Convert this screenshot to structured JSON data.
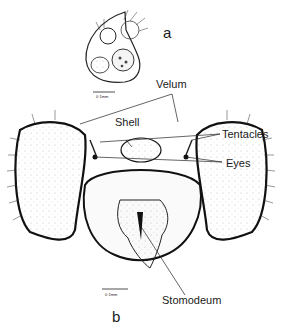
{
  "figure": {
    "panel_a": {
      "letter": "a",
      "scale_bar": "0·1mm"
    },
    "panel_b": {
      "letter": "b",
      "scale_bar": "0·1mm",
      "labels": {
        "velum": "Velum",
        "shell": "Shell",
        "tentacles": "Tentacles",
        "eyes": "Eyes",
        "stomodeum": "Stomodeum"
      }
    }
  }
}
